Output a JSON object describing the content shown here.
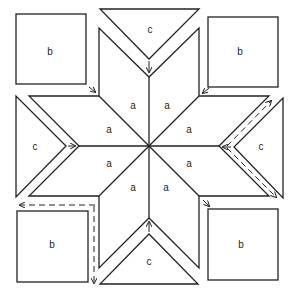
{
  "diagram": {
    "piece_labels": {
      "diamond": "a",
      "square": "b",
      "triangle": "c"
    },
    "colors": {
      "stroke": "#222222",
      "background": "#ffffff"
    },
    "labels": [
      {
        "id": "sq-tl",
        "text": "b",
        "x": 50,
        "y": 52
      },
      {
        "id": "sq-tr",
        "text": "b",
        "x": 240,
        "y": 52
      },
      {
        "id": "sq-bl",
        "text": "b",
        "x": 52,
        "y": 245
      },
      {
        "id": "sq-br",
        "text": "b",
        "x": 241,
        "y": 245
      },
      {
        "id": "tri-top",
        "text": "c",
        "x": 150,
        "y": 30
      },
      {
        "id": "tri-left",
        "text": "c",
        "x": 35,
        "y": 147
      },
      {
        "id": "tri-right",
        "text": "c",
        "x": 261,
        "y": 147
      },
      {
        "id": "tri-bottom",
        "text": "c",
        "x": 149,
        "y": 262
      },
      {
        "id": "dia-1",
        "text": "a",
        "x": 133,
        "y": 106
      },
      {
        "id": "dia-2",
        "text": "a",
        "x": 167,
        "y": 106
      },
      {
        "id": "dia-3",
        "text": "a",
        "x": 189,
        "y": 130
      },
      {
        "id": "dia-4",
        "text": "a",
        "x": 189,
        "y": 164
      },
      {
        "id": "dia-5",
        "text": "a",
        "x": 166,
        "y": 188
      },
      {
        "id": "dia-6",
        "text": "a",
        "x": 133,
        "y": 188
      },
      {
        "id": "dia-7",
        "text": "a",
        "x": 109,
        "y": 164
      },
      {
        "id": "dia-8",
        "text": "a",
        "x": 109,
        "y": 130
      }
    ]
  }
}
